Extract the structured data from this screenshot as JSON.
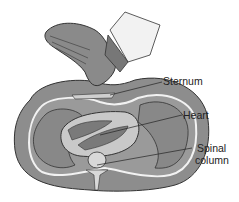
{
  "figure": {
    "labels": {
      "sternum": "Sternum",
      "heart": "Heart",
      "spinal_line1": "Spinal",
      "spinal_line2": "column"
    }
  }
}
